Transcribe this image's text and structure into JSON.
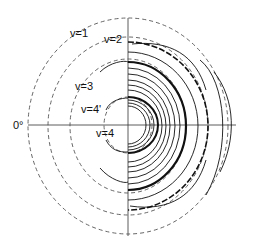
{
  "diagram": {
    "type": "polar contour plot",
    "center_label": "0°",
    "rings": [
      {
        "label": "v=1",
        "style": "dashed"
      },
      {
        "label": "v=2",
        "style": "dashed"
      },
      {
        "label": "v=3",
        "style": "dashed"
      },
      {
        "label": "v=4'",
        "style": "dashed"
      },
      {
        "label": "v=4",
        "style": "dashed"
      }
    ],
    "colors": {
      "line": "#111111",
      "dash": "#555555",
      "background": "#ffffff"
    }
  }
}
